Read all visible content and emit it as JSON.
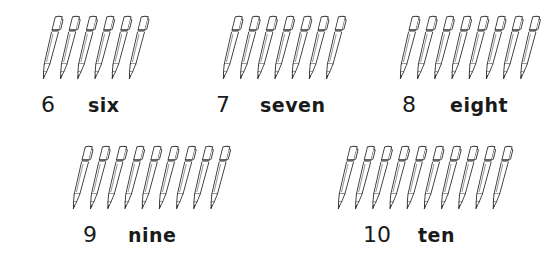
{
  "groups": [
    {
      "id": "six",
      "count": 6,
      "numeral": "6",
      "word": "six",
      "pens_x": 30,
      "pens_y": 15,
      "num_x": 41,
      "num_y": 94,
      "word_x": 88,
      "word_y": 96
    },
    {
      "id": "seven",
      "count": 7,
      "numeral": "7",
      "word": "seven",
      "pens_x": 210,
      "pens_y": 15,
      "num_x": 216,
      "num_y": 94,
      "word_x": 260,
      "word_y": 96
    },
    {
      "id": "eight",
      "count": 8,
      "numeral": "8",
      "word": "eight",
      "pens_x": 387,
      "pens_y": 15,
      "num_x": 402,
      "num_y": 94,
      "word_x": 450,
      "word_y": 96
    },
    {
      "id": "nine",
      "count": 9,
      "numeral": "9",
      "word": "nine",
      "pens_x": 60,
      "pens_y": 145,
      "num_x": 83,
      "num_y": 224,
      "word_x": 128,
      "word_y": 226
    },
    {
      "id": "ten",
      "count": 10,
      "numeral": "10",
      "word": "ten",
      "pens_x": 325,
      "pens_y": 145,
      "num_x": 363,
      "num_y": 224,
      "word_x": 418,
      "word_y": 226
    }
  ],
  "icon": "pen-icon",
  "colors": {
    "ink": "#1a1a1a",
    "background": "#ffffff",
    "pen_stroke": "#333333"
  }
}
